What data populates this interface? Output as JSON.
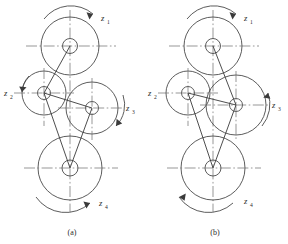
{
  "figure": {
    "type": "engineering-line-diagram",
    "background_color": "#ffffff",
    "line_color": "#4a4a4a",
    "label_color": "#2b2b2b",
    "width": 288,
    "height": 244
  },
  "panels": [
    {
      "id": "a",
      "caption": "(a)",
      "caption_x": 72,
      "caption_y": 234,
      "origin_x": 0,
      "gears": [
        {
          "name": "gear-z1-top",
          "cx": 70,
          "cy": 46,
          "r": 29,
          "hub_r": 7.5
        },
        {
          "name": "gear-z2-left",
          "cx": 44,
          "cy": 93,
          "r": 22,
          "hub_r": 6.5
        },
        {
          "name": "gear-z3-right",
          "cx": 92,
          "cy": 108,
          "r": 26,
          "hub_r": 6.5
        },
        {
          "name": "gear-z4-bottom",
          "cx": 70,
          "cy": 168,
          "r": 32,
          "hub_r": 8
        }
      ],
      "axes": [
        {
          "name": "axis-z1",
          "label": "z",
          "sub": "1",
          "lx": 101,
          "ly": 18,
          "type": "rotation-arrow"
        },
        {
          "name": "axis-z2",
          "label": "z",
          "sub": "2",
          "lx": 6,
          "ly": 95,
          "type": "horizontal-centerline"
        },
        {
          "name": "axis-z3",
          "label": "z",
          "sub": "3",
          "lx": 124,
          "ly": 110,
          "type": "horizontal-centerline"
        },
        {
          "name": "axis-z4",
          "label": "z",
          "sub": "4",
          "lx": 100,
          "ly": 207,
          "type": "rotation-arrow"
        }
      ]
    },
    {
      "id": "b",
      "caption": "(b)",
      "caption_x": 215,
      "caption_y": 234,
      "origin_x": 144,
      "gears": [
        {
          "name": "gear-z1-top",
          "cx": 213,
          "cy": 46,
          "r": 29,
          "hub_r": 7.5
        },
        {
          "name": "gear-z2-left",
          "cx": 188,
          "cy": 93,
          "r": 22,
          "hub_r": 6.5
        },
        {
          "name": "gear-z3-right",
          "cx": 236,
          "cy": 105,
          "r": 30,
          "hub_r": 6.5
        },
        {
          "name": "gear-z4-bottom",
          "cx": 213,
          "cy": 168,
          "r": 32,
          "hub_r": 8
        }
      ],
      "axes": [
        {
          "name": "axis-z1",
          "label": "z",
          "sub": "1",
          "lx": 244,
          "ly": 18,
          "type": "rotation-arrow"
        },
        {
          "name": "axis-z2",
          "label": "z",
          "sub": "2",
          "lx": 150,
          "ly": 95,
          "type": "horizontal-centerline"
        },
        {
          "name": "axis-z3",
          "label": "z",
          "sub": "3",
          "lx": 272,
          "ly": 108,
          "type": "horizontal-centerline"
        },
        {
          "name": "axis-z4",
          "label": "z",
          "sub": "4",
          "lx": 246,
          "ly": 207,
          "type": "rotation-arrow"
        }
      ]
    }
  ]
}
